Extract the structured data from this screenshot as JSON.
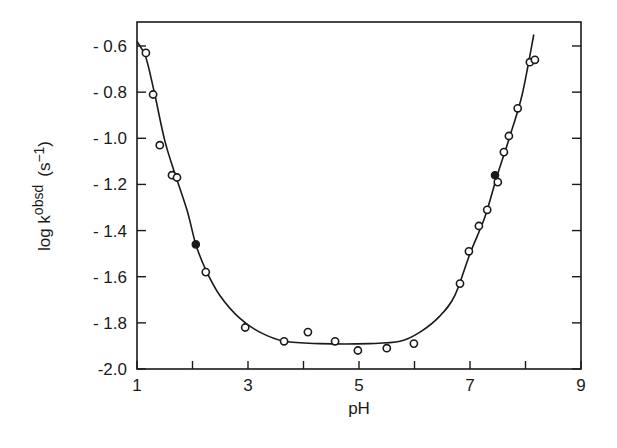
{
  "chart_data": {
    "type": "scatter",
    "title": "",
    "xlabel": "pH",
    "ylabel": "log k",
    "ylabel_superscript": "obsd",
    "ylabel_units": "(s",
    "ylabel_units_exp": "−1",
    "ylabel_units_close": ")",
    "xlim": [
      1,
      9
    ],
    "ylim": [
      -2.0,
      -0.5
    ],
    "grid": false,
    "legend": null,
    "x_ticks": [
      1,
      2,
      3,
      4,
      5,
      6,
      7,
      8,
      9
    ],
    "x_tick_labels": [
      {
        "value": 1,
        "label": "1"
      },
      {
        "value": 3,
        "label": "3"
      },
      {
        "value": 5,
        "label": "5"
      },
      {
        "value": 7,
        "label": "7"
      },
      {
        "value": 9,
        "label": "9"
      }
    ],
    "y_ticks": [
      -0.6,
      -0.8,
      -1.0,
      -1.2,
      -1.4,
      -1.6,
      -1.8,
      -2.0
    ],
    "y_tick_labels": [
      {
        "value": -0.6,
        "label": "- 0.6"
      },
      {
        "value": -0.8,
        "label": "- 0.8"
      },
      {
        "value": -1.0,
        "label": "- 1.0"
      },
      {
        "value": -1.2,
        "label": "- 1.2"
      },
      {
        "value": -1.4,
        "label": "- 1.4"
      },
      {
        "value": -1.6,
        "label": "- 1.6"
      },
      {
        "value": -1.8,
        "label": "- 1.8"
      },
      {
        "value": -2.0,
        "label": "-2.0"
      }
    ],
    "series": [
      {
        "name": "open circles",
        "marker": "open-circle",
        "points": [
          [
            1.16,
            -0.63
          ],
          [
            1.29,
            -0.81
          ],
          [
            1.41,
            -1.03
          ],
          [
            1.63,
            -1.16
          ],
          [
            1.72,
            -1.17
          ],
          [
            2.24,
            -1.58
          ],
          [
            2.95,
            -1.82
          ],
          [
            3.65,
            -1.88
          ],
          [
            4.08,
            -1.84
          ],
          [
            4.57,
            -1.88
          ],
          [
            4.98,
            -1.92
          ],
          [
            5.5,
            -1.91
          ],
          [
            5.99,
            -1.89
          ],
          [
            6.82,
            -1.63
          ],
          [
            6.98,
            -1.49
          ],
          [
            7.16,
            -1.38
          ],
          [
            7.31,
            -1.31
          ],
          [
            7.5,
            -1.19
          ],
          [
            7.61,
            -1.06
          ],
          [
            7.7,
            -0.99
          ],
          [
            7.86,
            -0.87
          ],
          [
            8.08,
            -0.67
          ],
          [
            8.17,
            -0.66
          ]
        ]
      },
      {
        "name": "filled circles",
        "marker": "filled-circle",
        "points": [
          [
            2.06,
            -1.46
          ],
          [
            7.45,
            -1.16
          ]
        ]
      },
      {
        "name": "fitted curve",
        "marker": "line",
        "points": [
          [
            1.0,
            -0.58
          ],
          [
            1.16,
            -0.65
          ],
          [
            1.32,
            -0.81
          ],
          [
            1.5,
            -1.01
          ],
          [
            1.68,
            -1.15
          ],
          [
            1.9,
            -1.31
          ],
          [
            2.06,
            -1.46
          ],
          [
            2.24,
            -1.57
          ],
          [
            2.49,
            -1.68
          ],
          [
            2.85,
            -1.78
          ],
          [
            3.21,
            -1.84
          ],
          [
            3.66,
            -1.88
          ],
          [
            4.29,
            -1.89
          ],
          [
            5.19,
            -1.89
          ],
          [
            5.74,
            -1.88
          ],
          [
            6.1,
            -1.84
          ],
          [
            6.46,
            -1.77
          ],
          [
            6.73,
            -1.68
          ],
          [
            7.0,
            -1.5
          ],
          [
            7.27,
            -1.34
          ],
          [
            7.48,
            -1.17
          ],
          [
            7.72,
            -0.99
          ],
          [
            7.94,
            -0.81
          ],
          [
            8.15,
            -0.55
          ]
        ]
      }
    ]
  }
}
